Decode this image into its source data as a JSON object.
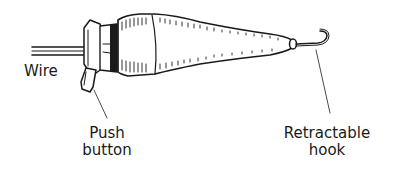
{
  "diagram": {
    "labels": {
      "wire": "Wire",
      "push_button_line1": "Push",
      "push_button_line2": "button",
      "hook_line1": "Retractable",
      "hook_line2": "hook"
    },
    "colors": {
      "ink": "#1a1a1a",
      "background": "#ffffff"
    }
  }
}
